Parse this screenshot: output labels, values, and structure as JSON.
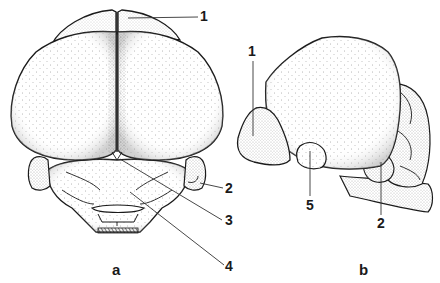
{
  "figure": {
    "panels": [
      {
        "id": "a",
        "label": "a",
        "view": "dorsal",
        "callouts": [
          {
            "number": "1"
          },
          {
            "number": "2"
          },
          {
            "number": "3"
          },
          {
            "number": "4"
          }
        ]
      },
      {
        "id": "b",
        "label": "b",
        "view": "lateral",
        "callouts": [
          {
            "number": "1"
          },
          {
            "number": "5"
          },
          {
            "number": "2"
          }
        ]
      }
    ]
  },
  "colors": {
    "ink": "#1a1a1a",
    "background": "#ffffff",
    "stipple": "#555555"
  }
}
